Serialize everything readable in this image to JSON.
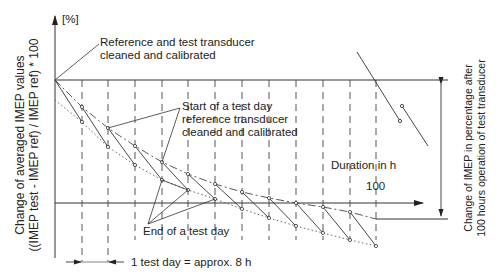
{
  "diagram": {
    "y_unit": "[%]",
    "y_axis_label_line1": "Change of averaged IMEP values",
    "y_axis_label_line2": "((IMEP test - IMEP ref) / IMEP ref) * 100",
    "right_label_line1": "Change of IMEP in percentage after",
    "right_label_line2": "100 hours operation of test transducer",
    "annotation_top_line1": "Reference and test transducer",
    "annotation_top_line2": "cleaned and calibrated",
    "annotation_start_line1": "Start of a test day",
    "annotation_start_line2": "reference transducer",
    "annotation_start_line3": "cleaned and calibrated",
    "annotation_end": "End of a test day",
    "x_axis_label": "Duration in h",
    "x_tick_label": "100",
    "test_day_label": "1 test day = approx. 8 h",
    "line_color": "#333333"
  }
}
